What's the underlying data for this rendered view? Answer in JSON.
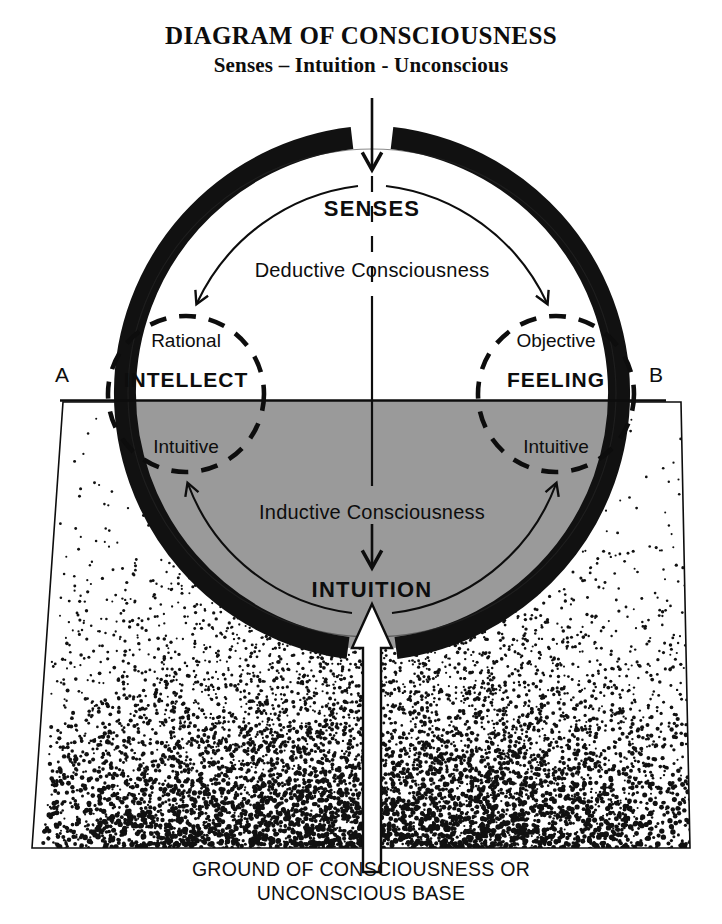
{
  "title": {
    "main": "DIAGRAM OF CONSCIOUSNESS",
    "sub": "Senses – Intuition - Unconscious"
  },
  "caption": {
    "line1": "GROUND OF CONSCIOUSNESS OR",
    "line2": "UNCONSCIOUS BASE"
  },
  "diagram": {
    "top_label": "SENSES",
    "upper_flow_label": "Deductive Consciousness",
    "lower_flow_label": "Inductive Consciousness",
    "bottom_label": "INTUITION",
    "left_node": {
      "upper": "Rational",
      "main": "INTELLECT",
      "lower": "Intuitive"
    },
    "right_node": {
      "upper": "Objective",
      "main": "FEELING",
      "lower": "Intuitive"
    },
    "axis": {
      "left_marker": "A",
      "right_marker": "B"
    }
  },
  "colors": {
    "ink": "#0d0d0d",
    "ring": "#111111",
    "shade": "#9a9a9a",
    "background": "#ffffff"
  }
}
